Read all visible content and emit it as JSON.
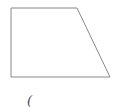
{
  "diagram": {
    "shape": "right-trapezoid",
    "stroke_color": "#888888",
    "fill_color": "#ffffff",
    "vertices": [
      {
        "x": 11,
        "y": 8
      },
      {
        "x": 77,
        "y": 8
      },
      {
        "x": 110,
        "y": 77
      },
      {
        "x": 11,
        "y": 77
      }
    ],
    "caption": "("
  }
}
